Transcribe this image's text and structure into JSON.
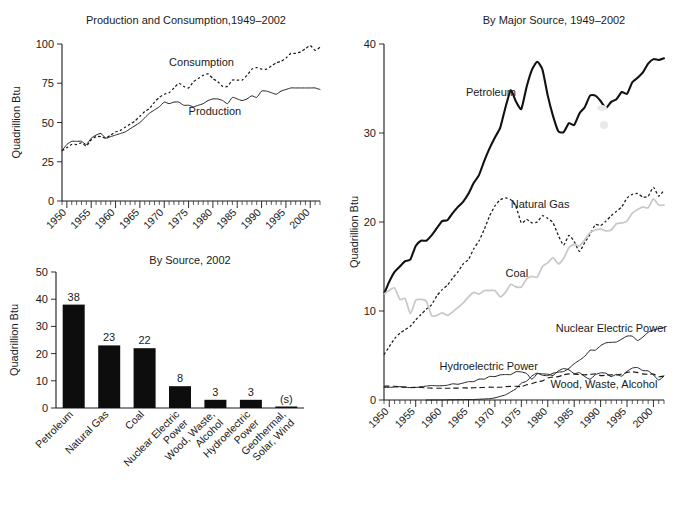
{
  "figure": {
    "units_label": "Quadrillion Btu"
  },
  "chart_data": [
    {
      "id": "production-consumption",
      "type": "line",
      "title": "Production and Consumption,1949–2002",
      "xlabel": "",
      "ylabel": "Quadrillion Btu",
      "ylim": [
        0,
        100
      ],
      "yticks": [
        0,
        25,
        50,
        75,
        100
      ],
      "ytick_labels": [
        "0",
        "25",
        "50",
        "75",
        "100"
      ],
      "xlim": [
        1949,
        2002
      ],
      "xticks": [
        1950,
        1955,
        1960,
        1965,
        1970,
        1975,
        1980,
        1985,
        1990,
        1995,
        2000
      ],
      "xtick_labels": [
        "1950",
        "1955",
        "1960",
        "1965",
        "1970",
        "1975",
        "1980",
        "1985",
        "1990",
        "1995",
        "2000"
      ],
      "minor_tick_interval": 1,
      "grid": false,
      "annotations": [
        {
          "text": "Consumption",
          "x": 1971,
          "y": 86
        },
        {
          "text": "Production",
          "x": 1975,
          "y": 55
        }
      ],
      "series": [
        {
          "name": "Consumption",
          "style": "dotted",
          "x": [
            1949,
            1950,
            1951,
            1952,
            1953,
            1954,
            1955,
            1956,
            1957,
            1958,
            1959,
            1960,
            1961,
            1962,
            1963,
            1964,
            1965,
            1966,
            1967,
            1968,
            1969,
            1970,
            1971,
            1972,
            1973,
            1974,
            1975,
            1976,
            1977,
            1978,
            1979,
            1980,
            1981,
            1982,
            1983,
            1984,
            1985,
            1986,
            1987,
            1988,
            1989,
            1990,
            1991,
            1992,
            1993,
            1994,
            1995,
            1996,
            1997,
            1998,
            1999,
            2000,
            2001,
            2002
          ],
          "values": [
            32,
            34,
            36,
            36,
            37,
            35,
            39,
            41,
            41,
            40,
            42,
            44,
            45,
            47,
            49,
            51,
            54,
            57,
            59,
            63,
            66,
            68,
            69,
            72,
            75,
            73,
            72,
            76,
            78,
            80,
            81,
            78,
            76,
            73,
            73,
            77,
            77,
            77,
            80,
            84,
            85,
            84,
            84,
            86,
            88,
            89,
            91,
            94,
            94,
            95,
            97,
            99,
            96,
            98
          ]
        },
        {
          "name": "Production",
          "style": "solid-thin",
          "x": [
            1949,
            1950,
            1951,
            1952,
            1953,
            1954,
            1955,
            1956,
            1957,
            1958,
            1959,
            1960,
            1961,
            1962,
            1963,
            1964,
            1965,
            1966,
            1967,
            1968,
            1969,
            1970,
            1971,
            1972,
            1973,
            1974,
            1975,
            1976,
            1977,
            1978,
            1979,
            1980,
            1981,
            1982,
            1983,
            1984,
            1985,
            1986,
            1987,
            1988,
            1989,
            1990,
            1991,
            1992,
            1993,
            1994,
            1995,
            1996,
            1997,
            1998,
            1999,
            2000,
            2001,
            2002
          ],
          "values": [
            32,
            36,
            38,
            38,
            38,
            36,
            40,
            42,
            43,
            40,
            41,
            42,
            43,
            44,
            46,
            48,
            50,
            53,
            56,
            58,
            60,
            63,
            62,
            63,
            63,
            61,
            61,
            60,
            61,
            62,
            64,
            65,
            65,
            64,
            62,
            66,
            65,
            64,
            65,
            67,
            66,
            70,
            70,
            69,
            68,
            70,
            71,
            72,
            72,
            72,
            72,
            72,
            72,
            71
          ]
        }
      ]
    },
    {
      "id": "by-source-2002",
      "type": "bar",
      "title": "By Source, 2002",
      "xlabel": "",
      "ylabel": "Quadrillion Btu",
      "ylim": [
        0,
        50
      ],
      "yticks": [
        0,
        10,
        20,
        30,
        40,
        50
      ],
      "ytick_labels": [
        "0",
        "10",
        "20",
        "30",
        "40",
        "50"
      ],
      "grid": false,
      "categories": [
        "Petroleum",
        "Natural Gas",
        "Coal",
        "Nuclear Electric\nPower",
        "Wood, Waste,\nAlcohol",
        "Hydroelectric\nPower",
        "Geothermal,\nSolar, Wind"
      ],
      "values": [
        38,
        23,
        22,
        8,
        3,
        3,
        0.5
      ],
      "value_labels": [
        "38",
        "23",
        "22",
        "8",
        "3",
        "3",
        "(s)"
      ]
    },
    {
      "id": "by-major-source",
      "type": "line",
      "title": "By Major Source, 1949–2002",
      "xlabel": "",
      "ylabel": "Quadrillion Btu",
      "ylim": [
        0,
        40
      ],
      "yticks": [
        0,
        10,
        20,
        30,
        40
      ],
      "ytick_labels": [
        "0",
        "10",
        "20",
        "30",
        "40"
      ],
      "xlim": [
        1949,
        2002
      ],
      "xticks": [
        1950,
        1955,
        1960,
        1965,
        1970,
        1975,
        1980,
        1985,
        1990,
        1995,
        2000
      ],
      "xtick_labels": [
        "1950",
        "1955",
        "1960",
        "1965",
        "1970",
        "1975",
        "1980",
        "1985",
        "1990",
        "1995",
        "2000"
      ],
      "minor_tick_interval": 1,
      "grid": false,
      "annotations": [
        {
          "text": "Petroleum",
          "x": 1964.5,
          "y": 34.2
        },
        {
          "text": "Natural Gas",
          "x": 1973.0,
          "y": 21.6
        },
        {
          "text": "Coal",
          "x": 1972.0,
          "y": 13.8
        },
        {
          "text": "Nuclear Electric Power",
          "x": 1981.5,
          "y": 7.6
        },
        {
          "text": "Hydroelectric Power",
          "x": 1959.5,
          "y": 3.4
        },
        {
          "text": "Wood, Waste, Alcohol",
          "x": 1980.5,
          "y": 1.35
        }
      ],
      "series": [
        {
          "name": "Petroleum",
          "style": "solid-thick",
          "x": [
            1949,
            1950,
            1951,
            1952,
            1953,
            1954,
            1955,
            1956,
            1957,
            1958,
            1959,
            1960,
            1961,
            1962,
            1963,
            1964,
            1965,
            1966,
            1967,
            1968,
            1969,
            1970,
            1971,
            1972,
            1973,
            1974,
            1975,
            1976,
            1977,
            1978,
            1979,
            1980,
            1981,
            1982,
            1983,
            1984,
            1985,
            1986,
            1987,
            1988,
            1989,
            1990,
            1991,
            1992,
            1993,
            1994,
            1995,
            1996,
            1997,
            1998,
            1999,
            2000,
            2001,
            2002
          ],
          "values": [
            11.9,
            13.3,
            14.4,
            15.0,
            15.6,
            15.8,
            17.3,
            17.9,
            17.9,
            18.5,
            19.3,
            20.1,
            20.2,
            21.0,
            21.7,
            22.3,
            23.2,
            24.4,
            25.3,
            26.9,
            28.3,
            29.5,
            30.6,
            32.9,
            34.8,
            33.5,
            32.7,
            35.2,
            37.1,
            38.0,
            37.1,
            34.2,
            31.9,
            30.2,
            30.1,
            31.1,
            30.9,
            32.2,
            32.9,
            34.2,
            34.2,
            33.6,
            32.8,
            33.5,
            33.8,
            34.6,
            34.4,
            35.7,
            36.2,
            36.8,
            37.8,
            38.3,
            38.2,
            38.4
          ]
        },
        {
          "name": "Natural Gas",
          "style": "dotted",
          "x": [
            1949,
            1950,
            1951,
            1952,
            1953,
            1954,
            1955,
            1956,
            1957,
            1958,
            1959,
            1960,
            1961,
            1962,
            1963,
            1964,
            1965,
            1966,
            1967,
            1968,
            1969,
            1970,
            1971,
            1972,
            1973,
            1974,
            1975,
            1976,
            1977,
            1978,
            1979,
            1980,
            1981,
            1982,
            1983,
            1984,
            1985,
            1986,
            1987,
            1988,
            1989,
            1990,
            1991,
            1992,
            1993,
            1994,
            1995,
            1996,
            1997,
            1998,
            1999,
            2000,
            2001,
            2002
          ],
          "values": [
            5.1,
            6.0,
            6.9,
            7.5,
            7.9,
            8.3,
            9.0,
            9.6,
            10.2,
            10.7,
            11.7,
            12.4,
            12.9,
            13.7,
            14.4,
            15.3,
            15.8,
            17.0,
            17.9,
            19.2,
            20.7,
            21.8,
            22.5,
            22.7,
            22.5,
            21.7,
            19.9,
            20.3,
            19.9,
            20.0,
            20.7,
            20.4,
            19.9,
            18.5,
            17.4,
            18.5,
            17.8,
            16.7,
            17.7,
            18.6,
            19.7,
            19.6,
            20.1,
            20.7,
            21.2,
            21.7,
            22.7,
            23.1,
            23.2,
            22.8,
            22.9,
            23.9,
            22.9,
            23.6
          ]
        },
        {
          "name": "Coal",
          "style": "gray",
          "x": [
            1949,
            1950,
            1951,
            1952,
            1953,
            1954,
            1955,
            1956,
            1957,
            1958,
            1959,
            1960,
            1961,
            1962,
            1963,
            1964,
            1965,
            1966,
            1967,
            1968,
            1969,
            1970,
            1971,
            1972,
            1973,
            1974,
            1975,
            1976,
            1977,
            1978,
            1979,
            1980,
            1981,
            1982,
            1983,
            1984,
            1985,
            1986,
            1987,
            1988,
            1989,
            1990,
            1991,
            1992,
            1993,
            1994,
            1995,
            1996,
            1997,
            1998,
            1999,
            2000,
            2001,
            2002
          ],
          "values": [
            11.9,
            12.3,
            12.6,
            11.3,
            11.4,
            9.7,
            11.2,
            11.3,
            11.1,
            9.5,
            9.5,
            9.8,
            9.5,
            9.9,
            10.4,
            10.9,
            11.6,
            12.1,
            11.9,
            12.3,
            12.3,
            12.3,
            11.6,
            12.1,
            13.0,
            12.7,
            12.7,
            13.6,
            13.9,
            13.8,
            15.0,
            15.4,
            16.0,
            15.3,
            15.9,
            17.1,
            17.5,
            17.3,
            18.0,
            18.8,
            19.1,
            19.2,
            19.0,
            19.1,
            19.8,
            19.9,
            20.1,
            21.0,
            21.4,
            21.7,
            21.6,
            22.6,
            21.9,
            21.9
          ]
        },
        {
          "name": "Nuclear Electric Power",
          "style": "solid-thin",
          "x": [
            1957,
            1960,
            1963,
            1966,
            1969,
            1970,
            1971,
            1972,
            1973,
            1974,
            1975,
            1976,
            1977,
            1978,
            1979,
            1980,
            1981,
            1982,
            1983,
            1984,
            1985,
            1986,
            1987,
            1988,
            1989,
            1990,
            1991,
            1992,
            1993,
            1994,
            1995,
            1996,
            1997,
            1998,
            1999,
            2000,
            2001,
            2002
          ],
          "values": [
            0.0,
            0.01,
            0.04,
            0.06,
            0.15,
            0.24,
            0.41,
            0.58,
            0.91,
            1.27,
            1.9,
            2.11,
            2.7,
            3.02,
            2.78,
            2.74,
            3.01,
            3.13,
            3.2,
            3.55,
            4.08,
            4.47,
            4.91,
            5.59,
            5.6,
            6.1,
            6.42,
            6.48,
            6.52,
            6.84,
            7.18,
            7.17,
            6.68,
            7.07,
            7.61,
            7.86,
            8.03,
            8.14
          ]
        },
        {
          "name": "Hydroelectric Power",
          "style": "solid-thin",
          "x": [
            1949,
            1950,
            1951,
            1952,
            1953,
            1954,
            1955,
            1956,
            1957,
            1958,
            1959,
            1960,
            1961,
            1962,
            1963,
            1964,
            1965,
            1966,
            1967,
            1968,
            1969,
            1970,
            1971,
            1972,
            1973,
            1974,
            1975,
            1976,
            1977,
            1978,
            1979,
            1980,
            1981,
            1982,
            1983,
            1984,
            1985,
            1986,
            1987,
            1988,
            1989,
            1990,
            1991,
            1992,
            1993,
            1994,
            1995,
            1996,
            1997,
            1998,
            1999,
            2000,
            2001,
            2002
          ],
          "values": [
            1.42,
            1.42,
            1.45,
            1.5,
            1.44,
            1.39,
            1.4,
            1.49,
            1.56,
            1.63,
            1.59,
            1.61,
            1.66,
            1.82,
            1.77,
            1.91,
            2.06,
            2.07,
            2.35,
            2.35,
            2.65,
            2.63,
            2.82,
            2.86,
            2.86,
            3.18,
            3.15,
            2.98,
            2.33,
            2.94,
            2.93,
            2.9,
            2.76,
            3.27,
            3.53,
            3.39,
            2.97,
            3.07,
            2.63,
            2.33,
            2.84,
            3.05,
            3.01,
            2.62,
            2.89,
            2.68,
            3.21,
            3.59,
            3.64,
            3.3,
            3.27,
            2.81,
            2.24,
            2.69
          ]
        },
        {
          "name": "Wood, Waste, Alcohol",
          "style": "dashed",
          "x": [
            1949,
            1950,
            1951,
            1952,
            1953,
            1954,
            1955,
            1956,
            1957,
            1958,
            1959,
            1960,
            1961,
            1962,
            1963,
            1964,
            1965,
            1966,
            1967,
            1968,
            1969,
            1970,
            1971,
            1972,
            1973,
            1974,
            1975,
            1976,
            1977,
            1978,
            1979,
            1980,
            1981,
            1982,
            1983,
            1984,
            1985,
            1986,
            1987,
            1988,
            1989,
            1990,
            1991,
            1992,
            1993,
            1994,
            1995,
            1996,
            1997,
            1998,
            1999,
            2000,
            2001,
            2002
          ],
          "values": [
            1.55,
            1.56,
            1.54,
            1.47,
            1.44,
            1.4,
            1.42,
            1.41,
            1.36,
            1.33,
            1.32,
            1.32,
            1.32,
            1.33,
            1.34,
            1.37,
            1.34,
            1.38,
            1.39,
            1.41,
            1.44,
            1.43,
            1.43,
            1.5,
            1.53,
            1.54,
            1.5,
            1.71,
            1.84,
            2.04,
            2.15,
            2.48,
            2.59,
            2.62,
            2.83,
            2.93,
            2.91,
            2.86,
            2.83,
            2.87,
            2.94,
            2.74,
            2.78,
            2.83,
            2.8,
            2.93,
            3.1,
            3.16,
            3.08,
            2.93,
            2.89,
            2.91,
            2.62,
            2.7
          ]
        }
      ]
    }
  ]
}
